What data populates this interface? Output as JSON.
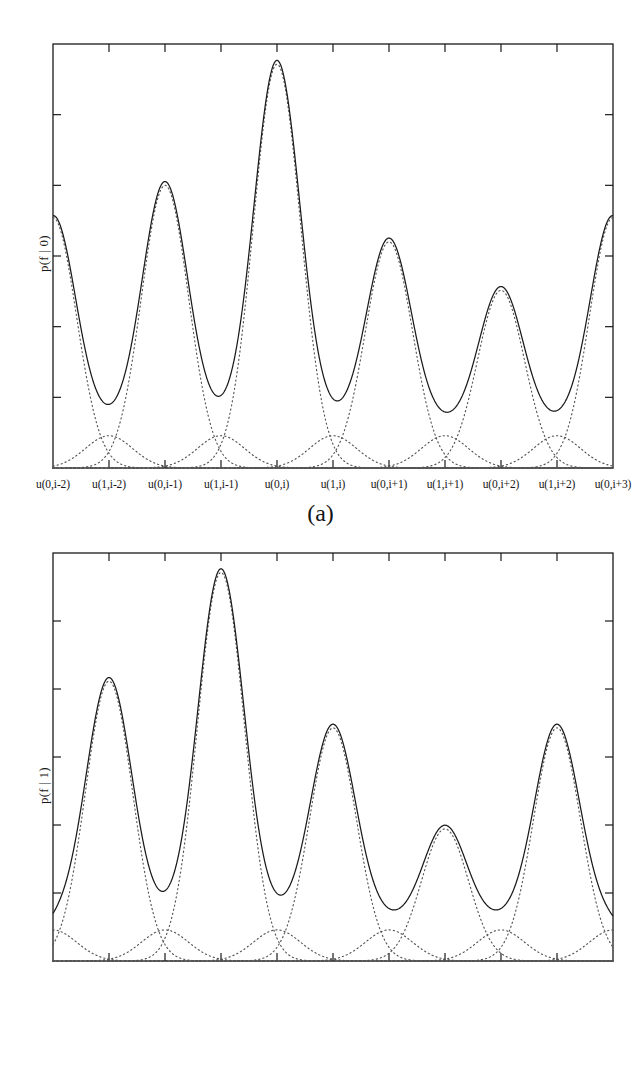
{
  "figure": {
    "background": "#ffffff",
    "ink": "#1a1a1a",
    "dotted_color": "#555555"
  },
  "panels": [
    {
      "id": "a",
      "caption": "(a)",
      "ylabel": "p(f | 0)",
      "axis": {
        "frame_left": 53,
        "frame_right": 613,
        "frame_top": 44,
        "frame_bottom": 468,
        "n_xticks": 11,
        "n_yticks": 7,
        "grid": false
      }
    },
    {
      "id": "b",
      "caption": "(b)",
      "ylabel": "p(f | 1)",
      "axis": {
        "frame_left": 53,
        "frame_right": 613,
        "frame_top": 553,
        "frame_bottom": 961,
        "n_xticks": 11,
        "n_yticks": 7,
        "grid": false
      }
    }
  ],
  "xticklabels": [
    "u(0,i-2)",
    "u(1,i-2)",
    "u(0,i-1)",
    "u(1,i-1)",
    "u(0,i)",
    "u(1,i)",
    "u(0,i+1)",
    "u(1,i+1)",
    "u(0,i+2)",
    "u(1,i+2)",
    "u(0,i+3)"
  ],
  "chart_data": {
    "type": "line",
    "title": "",
    "xlabel": "",
    "ylabel": "p(f | b)",
    "xlim": [
      0,
      10
    ],
    "ylim": [
      0,
      1.05
    ],
    "grid": false,
    "legend": "none",
    "component_sigma": 0.42,
    "charts": [
      {
        "panel": "a",
        "type": "line",
        "title": "(a)",
        "ylabel": "p(f | 0)",
        "xlabel": "",
        "categories": [
          "u(0,i-2)",
          "u(1,i-2)",
          "u(0,i-1)",
          "u(1,i-1)",
          "u(0,i)",
          "u(1,i)",
          "u(0,i+1)",
          "u(1,i+1)",
          "u(0,i+2)",
          "u(1,i+2)",
          "u(0,i+3)"
        ],
        "x": [
          0,
          1,
          2,
          3,
          4,
          5,
          6,
          7,
          8,
          9,
          10
        ],
        "series": [
          {
            "name": "component amplitudes (dotted Gaussians)",
            "values": [
              0.62,
              0.08,
              0.7,
              0.08,
              1.0,
              0.08,
              0.56,
              0.08,
              0.44,
              0.08,
              0.62
            ]
          }
        ],
        "solid_curve": "sum of the dotted Gaussian components",
        "peaks": [
          {
            "x": 0,
            "label": "u(0,i-2)",
            "height": 0.62
          },
          {
            "x": 2,
            "label": "u(0,i-1)",
            "height": 0.7
          },
          {
            "x": 4,
            "label": "u(0,i)",
            "height": 1.0
          },
          {
            "x": 6,
            "label": "u(0,i+1)",
            "height": 0.56
          },
          {
            "x": 8,
            "label": "u(0,i+2)",
            "height": 0.44
          },
          {
            "x": 10,
            "label": "u(0,i+3)",
            "height": 0.62
          }
        ]
      },
      {
        "panel": "b",
        "type": "line",
        "title": "(b)",
        "ylabel": "p(f | 1)",
        "xlabel": "",
        "categories": [
          "u(0,i-2)",
          "u(1,i-2)",
          "u(0,i-1)",
          "u(1,i-1)",
          "u(0,i)",
          "u(1,i)",
          "u(0,i+1)",
          "u(1,i+1)",
          "u(0,i+2)",
          "u(1,i+2)",
          "u(0,i+3)"
        ],
        "x": [
          0,
          1,
          2,
          3,
          4,
          5,
          6,
          7,
          8,
          9,
          10
        ],
        "series": [
          {
            "name": "component amplitudes (dotted Gaussians)",
            "values": [
              0.08,
              0.72,
              0.08,
              1.0,
              0.08,
              0.6,
              0.08,
              0.34,
              0.08,
              0.6,
              0.08
            ]
          }
        ],
        "solid_curve": "sum of the dotted Gaussian components",
        "peaks": [
          {
            "x": 1,
            "label": "u(1,i-2)",
            "height": 0.72
          },
          {
            "x": 3,
            "label": "u(1,i-1)",
            "height": 1.0
          },
          {
            "x": 5,
            "label": "u(1,i)",
            "height": 0.6
          },
          {
            "x": 7,
            "label": "u(1,i+1)",
            "height": 0.34
          },
          {
            "x": 9,
            "label": "u(1,i+2)",
            "height": 0.6
          }
        ]
      }
    ]
  }
}
